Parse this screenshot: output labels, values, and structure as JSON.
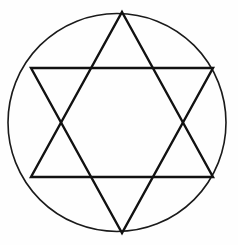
{
  "figure": {
    "title": "Star of David (hexagram) inscribed in a circle",
    "background_color": "#fefefe",
    "stroke_color": "#111111",
    "canvas": {
      "width": 238,
      "height": 245
    },
    "circle": {
      "label": "circumscribed-circle",
      "center_x": 117,
      "center_y": 122.5,
      "radius": 109,
      "stroke_width": 1.6,
      "fill": "none",
      "stroke_color": "#1a1a1a"
    },
    "hexagram": {
      "label": "hexagram-star-of-david",
      "stroke_width": 2.4,
      "fill": "none",
      "stroke_color": "#111111",
      "upward_triangle": {
        "label": "upward-triangle",
        "points": "122,12 213,177 31,177",
        "vertices": [
          {
            "name": "apex-top",
            "x": 122,
            "y": 12
          },
          {
            "name": "base-right",
            "x": 213,
            "y": 177
          },
          {
            "name": "base-left",
            "x": 31,
            "y": 177
          }
        ]
      },
      "downward_triangle": {
        "label": "downward-triangle",
        "points": "122,233 31,68 213,68",
        "vertices": [
          {
            "name": "apex-bottom",
            "x": 122,
            "y": 233
          },
          {
            "name": "base-left",
            "x": 31,
            "y": 68
          },
          {
            "name": "base-right",
            "x": 213,
            "y": 68
          }
        ]
      }
    }
  }
}
